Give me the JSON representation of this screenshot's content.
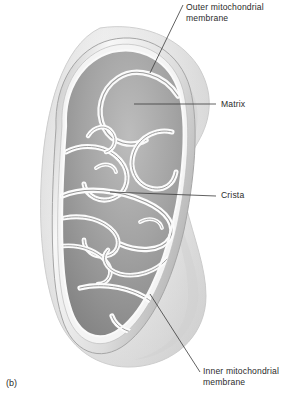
{
  "figure": {
    "caption": "(b)",
    "background_color": "#ffffff",
    "line_color": "#3a3a3a",
    "text_color": "#2b2b2b"
  },
  "labels": {
    "outer_membrane": "Outer mitochondrial\nmembrane",
    "matrix": "Matrix",
    "crista": "Crista",
    "inner_membrane": "Inner mitochondrial\nmembrane"
  },
  "leader_lines": [
    {
      "name": "outer-membrane-leader",
      "x1": 183,
      "y1": 5,
      "x2": 150,
      "y2": 73
    },
    {
      "name": "matrix-leader",
      "x1": 216,
      "y1": 104,
      "x2": 134,
      "y2": 104
    },
    {
      "name": "crista-leader",
      "x1": 216,
      "y1": 196,
      "x2": 110,
      "y2": 192
    },
    {
      "name": "inner-membrane-leader",
      "x1": 200,
      "y1": 372,
      "x2": 150,
      "y2": 294
    }
  ],
  "anatomy": {
    "outer_membrane_label": "outer mitochondrial membrane",
    "inner_membrane_label": "inner mitochondrial membrane",
    "matrix_label": "matrix",
    "crista_label": "crista",
    "palette": {
      "body_light": "#f2f2f2",
      "body_mid": "#d8d8d8",
      "body_shadow": "#b9b9b9",
      "matrix_dark": "#8e8e8e",
      "matrix_mid": "#a8a8a8",
      "crista_highlight": "#fdfdfd",
      "outline": "#9a9a9a"
    }
  }
}
